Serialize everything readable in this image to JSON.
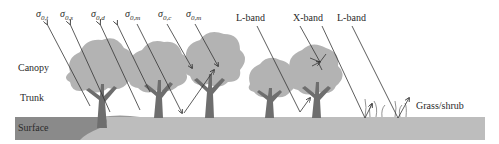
{
  "diagram": {
    "type": "microwave scattering mechanisms over vegetated terrain",
    "layers": [
      {
        "name": "canopy",
        "label": "Canopy"
      },
      {
        "name": "trunk",
        "label": "Trunk"
      },
      {
        "name": "surface",
        "label": "Surface"
      }
    ],
    "scattering_terms": [
      {
        "symbol": "σ",
        "sub": "0,t"
      },
      {
        "symbol": "σ",
        "sub": "0,s"
      },
      {
        "symbol": "σ",
        "sub": "0,d"
      },
      {
        "symbol": "σ",
        "sub": "0,m"
      },
      {
        "symbol": "σ",
        "sub": "0,c"
      },
      {
        "symbol": "σ",
        "sub": "0,m"
      }
    ],
    "bands": [
      "L-band",
      "X-band",
      "L-band"
    ],
    "ground_cover_label": "Grass/shrub",
    "colors": {
      "foliage": "#b3b3b3",
      "trunk": "#6e6e6e",
      "surface_dark": "#8a8a8a",
      "surface_light": "#bdbdbd",
      "arrow": "#333333"
    }
  }
}
